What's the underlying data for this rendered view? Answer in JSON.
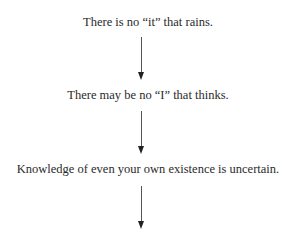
{
  "diagram": {
    "type": "flow",
    "direction": "top-to-bottom",
    "nodes": [
      {
        "label": "There is no “it” that rains."
      },
      {
        "label": "There may be no “I” that thinks."
      },
      {
        "label": "Knowledge of even your own existence is uncertain."
      }
    ],
    "edges": [
      {
        "from": 0,
        "to": 1
      },
      {
        "from": 1,
        "to": 2
      },
      {
        "from": 2,
        "to": null
      }
    ],
    "colors": {
      "text": "#2a2a2a",
      "arrow": "#222222",
      "background": "#ffffff"
    }
  }
}
